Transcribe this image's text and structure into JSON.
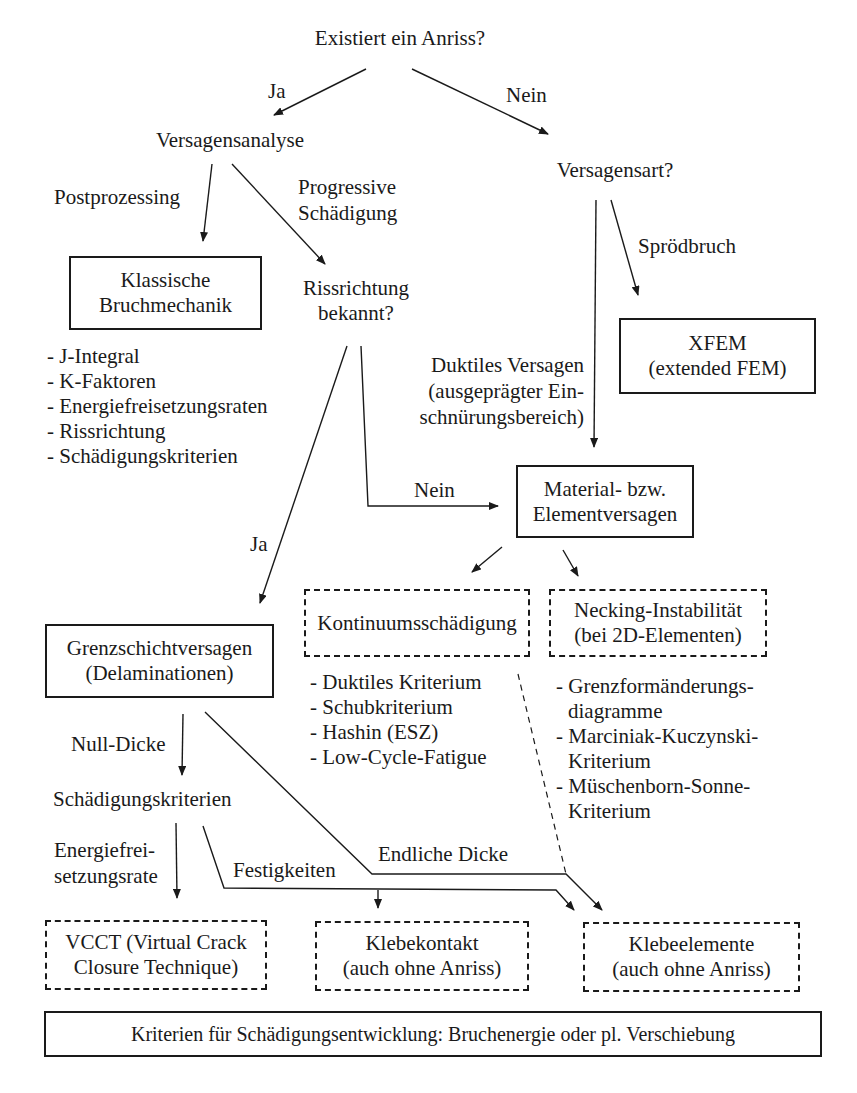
{
  "top_cut_text": "Lösungsansätze:",
  "nodes": {
    "root": "Existiert ein Anriss?",
    "versagensanalyse": "Versagensanalyse",
    "versagensart": "Versagensart?",
    "klassische": "Klassische\nBruchmechanik",
    "rissrichtung_q": "Rissrichtung\nbekannt?",
    "xfem": "XFEM\n(extended FEM)",
    "material": "Material- bzw.\nElementversagen",
    "kontinuum": "Kontinuumsschädigung",
    "necking": "Necking-Instabilität\n(bei 2D-Elementen)",
    "grenzschicht": "Grenzschichtversagen\n(Delaminationen)",
    "schaedigungskriterien": "Schädigungskriterien",
    "vcct": "VCCT (Virtual Crack\nClosure Technique)",
    "klebekontakt": "Klebekontakt\n(auch ohne Anriss)",
    "klebeelemente": "Klebeelemente\n(auch ohne Anriss)",
    "footer": "Kriterien für Schädigungsentwicklung: Bruchenergie oder pl. Verschiebung"
  },
  "edge_labels": {
    "ja_top": "Ja",
    "nein_top": "Nein",
    "postprozessing": "Postprozessing",
    "progressive_1": "Progressive",
    "progressive_2": "Schädigung",
    "sproedbruch": "Sprödbruch",
    "duktil_1": "Duktiles Versagen",
    "duktil_2": "(ausgeprägter Ein-",
    "duktil_3": "schnürungsbereich)",
    "nein_mid": "Nein",
    "ja_mid": "Ja",
    "null_dicke": "Null-Dicke",
    "energie_1": "Energiefrei-",
    "energie_2": "setzungsrate",
    "festigkeiten": "Festigkeiten",
    "endliche_dicke": "Endliche Dicke"
  },
  "lists": {
    "klassische": [
      "- J-Integral",
      "- K-Faktoren",
      "- Energiefreisetzungsraten",
      "- Rissrichtung",
      "- Schädigungskriterien"
    ],
    "kontinuum": [
      "- Duktiles Kriterium",
      "- Schubkriterium",
      "- Hashin (ESZ)",
      "- Low-Cycle-Fatigue"
    ],
    "necking": [
      {
        "first": "- Grenzformänderungs-",
        "cont": "diagramme"
      },
      {
        "first": "- Marciniak-Kuczynski-",
        "cont": "Kriterium"
      },
      {
        "first": "- Müschenborn-Sonne-",
        "cont": "Kriterium"
      }
    ]
  }
}
